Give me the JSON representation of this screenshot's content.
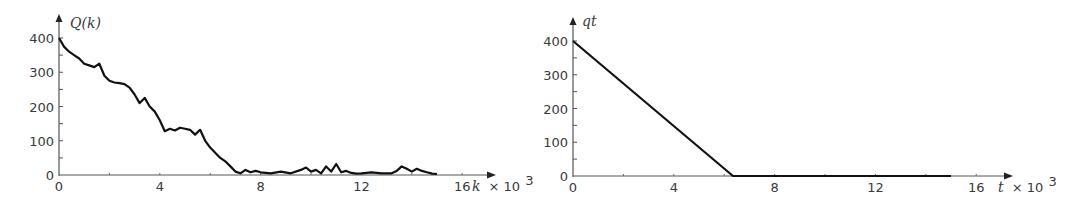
{
  "chart_data": [
    {
      "type": "line",
      "title": "",
      "ylabel": "Q(k)",
      "xlabel": "k × 10³",
      "x_tick_labels": [
        "0",
        "4",
        "8",
        "12",
        "16"
      ],
      "y_tick_labels": [
        "0",
        "100",
        "200",
        "300",
        "400"
      ],
      "xlim": [
        0,
        16
      ],
      "ylim": [
        0,
        420
      ],
      "grid": false,
      "legend": null,
      "series": [
        {
          "name": "Q(k)",
          "color": "#111111",
          "x": [
            0,
            0.2,
            0.4,
            0.6,
            0.8,
            1.0,
            1.2,
            1.4,
            1.6,
            1.8,
            2.0,
            2.2,
            2.4,
            2.6,
            2.8,
            3.0,
            3.2,
            3.4,
            3.6,
            3.8,
            4.0,
            4.2,
            4.4,
            4.6,
            4.8,
            5.0,
            5.2,
            5.4,
            5.6,
            5.8,
            6.0,
            6.2,
            6.4,
            6.6,
            6.8,
            7.0,
            7.2,
            7.4,
            7.6,
            7.8,
            8.0,
            8.4,
            8.8,
            9.2,
            9.6,
            9.8,
            10.0,
            10.2,
            10.4,
            10.6,
            10.8,
            11.0,
            11.2,
            11.4,
            11.6,
            11.8,
            12.0,
            12.4,
            12.8,
            13.2,
            13.4,
            13.6,
            13.8,
            14.0,
            14.2,
            14.4,
            14.6,
            14.8,
            15.0
          ],
          "y": [
            400,
            375,
            360,
            350,
            340,
            325,
            320,
            315,
            325,
            290,
            275,
            270,
            268,
            265,
            255,
            235,
            210,
            225,
            200,
            185,
            160,
            128,
            135,
            130,
            138,
            135,
            132,
            118,
            132,
            100,
            80,
            65,
            50,
            40,
            25,
            10,
            5,
            15,
            8,
            12,
            8,
            5,
            10,
            5,
            15,
            22,
            10,
            15,
            5,
            25,
            10,
            32,
            8,
            12,
            6,
            4,
            5,
            8,
            5,
            5,
            12,
            25,
            18,
            10,
            18,
            12,
            8,
            4,
            3
          ]
        }
      ]
    },
    {
      "type": "line",
      "title": "",
      "ylabel": "qt",
      "xlabel": "t × 10³",
      "x_tick_labels": [
        "0",
        "4",
        "8",
        "12",
        "16"
      ],
      "y_tick_labels": [
        "0",
        "100",
        "200",
        "300",
        "400"
      ],
      "xlim": [
        0,
        16
      ],
      "ylim": [
        0,
        420
      ],
      "grid": false,
      "legend": null,
      "series": [
        {
          "name": "qt",
          "color": "#111111",
          "x": [
            0,
            6.35,
            15
          ],
          "y": [
            400,
            0,
            0
          ]
        }
      ]
    }
  ],
  "charts": {
    "left": {
      "ylabel": "Q(k)",
      "xlabel_var": "k",
      "xlabel_suffix": "× 10",
      "xlabel_exp": "3",
      "x_ticks": [
        "0",
        "4",
        "8",
        "12",
        "16"
      ],
      "y_ticks": [
        "0",
        "100",
        "200",
        "300",
        "400"
      ]
    },
    "right": {
      "ylabel": "qt",
      "xlabel_var": "t",
      "xlabel_suffix": "× 10",
      "xlabel_exp": "3",
      "x_ticks": [
        "0",
        "4",
        "8",
        "12",
        "16"
      ],
      "y_ticks": [
        "0",
        "100",
        "200",
        "300",
        "400"
      ]
    }
  }
}
